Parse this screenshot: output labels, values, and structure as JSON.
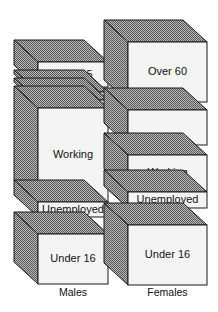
{
  "title": "",
  "colors": {
    "front_face": "#f4f4f4",
    "hatch_dark": "#555555",
    "hatch_light": "#bdbdbd",
    "outline": "#1a1a1a",
    "text": "#111111"
  },
  "depth": {
    "dx": -24,
    "dy": -22
  },
  "columns": [
    {
      "id": "males",
      "label": "Males",
      "front_x": 38,
      "front_w": 70,
      "label_y": 296,
      "blocks": [
        {
          "id": "m-over65",
          "label": "Over 65",
          "y": 62,
          "h": 25
        },
        {
          "id": "m-slab1",
          "label": "",
          "y": 92,
          "h": 4
        },
        {
          "id": "m-slab2",
          "label": "",
          "y": 100,
          "h": 4
        },
        {
          "id": "m-working",
          "label": "Working",
          "y": 108,
          "h": 94
        },
        {
          "id": "m-unemployed",
          "label": "Unemployed",
          "y": 202,
          "h": 15
        },
        {
          "id": "m-under16",
          "label": "Under 16",
          "y": 234,
          "h": 50
        }
      ]
    },
    {
      "id": "females",
      "label": "Females",
      "front_x": 128,
      "front_w": 79,
      "label_y": 296,
      "blocks": [
        {
          "id": "f-over60",
          "label": "Over 60",
          "y": 42,
          "h": 60
        },
        {
          "id": "f-other",
          "label": "",
          "y": 110,
          "h": 35
        },
        {
          "id": "f-working",
          "label": "Working",
          "y": 155,
          "h": 36
        },
        {
          "id": "f-unemployed",
          "label": "Unemployed",
          "y": 192,
          "h": 16
        },
        {
          "id": "f-under16",
          "label": "Under 16",
          "y": 225,
          "h": 60
        }
      ]
    }
  ]
}
